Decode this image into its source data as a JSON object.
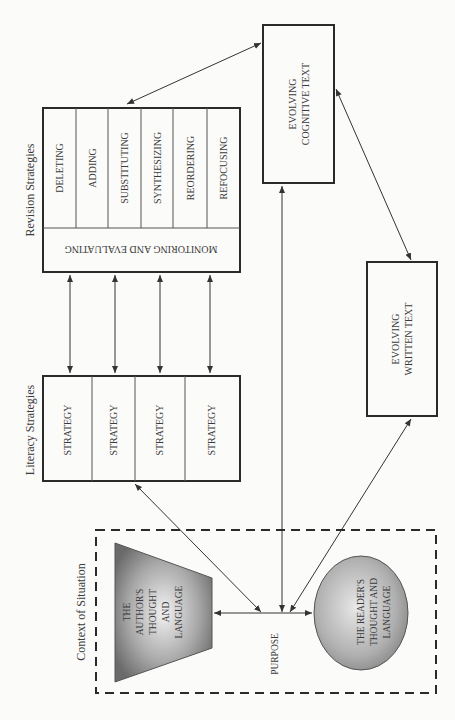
{
  "diagram": {
    "revision": {
      "title": "Revision Strategies",
      "items": [
        "DELETING",
        "ADDING",
        "SUBSTITUTING",
        "SYNTHESIZING",
        "REORDERING",
        "REFOCUSING"
      ],
      "monitor": "MONITORING AND EVALUATING"
    },
    "literacy": {
      "title": "Literacy Strategies",
      "items": [
        "STRATEGY",
        "STRATEGY",
        "STRATEGY",
        "STRATEGY"
      ]
    },
    "cognitive": {
      "line1": "EVOLVING",
      "line2": "COGNITIVE TEXT"
    },
    "written": {
      "line1": "EVOLVING",
      "line2": "WRITTEN TEXT"
    },
    "context": {
      "title": "Context of Situation",
      "author": [
        "THE",
        "AUTHOR'S",
        "THOUGHT",
        "AND",
        "LANGUAGE"
      ],
      "purpose": "PURPOSE",
      "reader": [
        "THE READER'S",
        "THOUGHT AND",
        "LANGUAGE"
      ]
    },
    "colors": {
      "shape_dark": "#6f6f6f",
      "shape_light": "#e8e8e8",
      "line": "#2a2a2a"
    }
  }
}
